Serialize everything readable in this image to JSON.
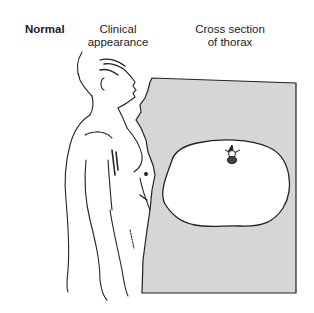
{
  "diagram": {
    "condition_label": "Normal",
    "column_headings": [
      {
        "line1": "Clinical",
        "line2": "appearance"
      },
      {
        "line1": "Cross section",
        "line2": "of thorax"
      }
    ],
    "colors": {
      "panel_fill": "#d6d6d6",
      "outline": "#222222",
      "thorax_fill": "#ffffff"
    },
    "figures": [
      {
        "name": "clinical-appearance-figure",
        "description": "side profile of male torso, normal posture"
      },
      {
        "name": "thorax-cross-section",
        "description": "oval thoracic cross section with vertebra at top"
      }
    ]
  }
}
